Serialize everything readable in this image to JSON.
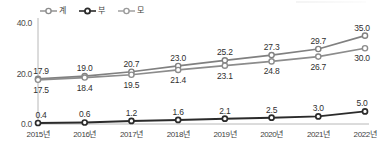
{
  "chart_data": {
    "type": "line",
    "title": "",
    "subtitle": "",
    "xlabel": "",
    "ylabel": "",
    "categories": [
      "2015년",
      "2016년",
      "2017년",
      "2018년",
      "2019년",
      "2020년",
      "2021년",
      "2022년"
    ],
    "ylim": [
      0.0,
      40.0
    ],
    "yticks": [
      "0.0",
      "20.0",
      "40.0"
    ],
    "ytick_values": [
      0.0,
      20.0,
      40.0
    ],
    "grid": false,
    "legend_position": "top-left",
    "series": [
      {
        "name": "계",
        "color": "#808080",
        "marker": "open-circle",
        "label_position": "above",
        "values": [
          17.9,
          19.0,
          20.7,
          23.0,
          25.2,
          27.3,
          29.7,
          35.0
        ],
        "labels": [
          "17.9",
          "19.0",
          "20.7",
          "23.0",
          "25.2",
          "27.3",
          "29.7",
          "35.0"
        ]
      },
      {
        "name": "부",
        "color": "#2b2b2b",
        "marker": "open-circle",
        "label_position": "above",
        "values": [
          0.4,
          0.6,
          1.2,
          1.6,
          2.1,
          2.5,
          3.0,
          5.0
        ],
        "labels": [
          "0.4",
          "0.6",
          "1.2",
          "1.6",
          "2.1",
          "2.5",
          "3.0",
          "5.0"
        ]
      },
      {
        "name": "모",
        "color": "#8c8c8c",
        "marker": "open-circle",
        "label_position": "below",
        "values": [
          17.5,
          18.4,
          19.5,
          21.4,
          23.1,
          24.8,
          26.7,
          30.0
        ],
        "labels": [
          "17.5",
          "18.4",
          "19.5",
          "21.4",
          "23.1",
          "24.8",
          "26.7",
          "30.0"
        ]
      }
    ]
  },
  "axis": {
    "line_color": "#b8b8b8"
  }
}
